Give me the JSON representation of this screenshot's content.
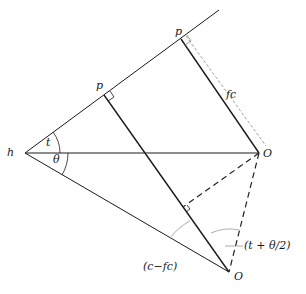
{
  "diagram": {
    "type": "geometric construction",
    "labels": {
      "vertex_h": "h",
      "angle_t": "t",
      "angle_theta": "θ",
      "point_p_middle": "p",
      "point_p_upper": "p",
      "segment_fc": "fc",
      "point_o_right": "O",
      "point_o_bottom": "O",
      "angle_c_minus_fc": "(c−fc)",
      "angle_t_plus_theta_half": "(t + θ/2)"
    },
    "colors": {
      "line": "#1a1a1a",
      "dashed": "#222222",
      "dotted": "#888888"
    }
  }
}
